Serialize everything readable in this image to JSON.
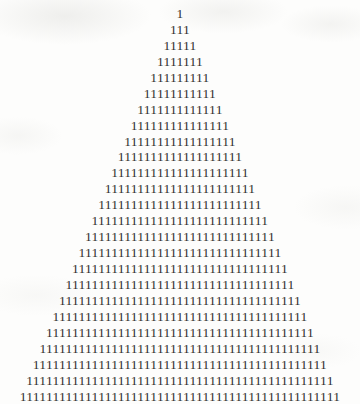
{
  "document": {
    "kind": "scanned-page-figure",
    "figure_name": "digit-one-pyramid",
    "character": "1",
    "background_color": "#fdfdfc",
    "ink_color": "#33312f",
    "row_count": 25,
    "total_characters": 625,
    "rows": [
      {
        "index": 1,
        "count": 1,
        "text": "1"
      },
      {
        "index": 2,
        "count": 3,
        "text": "111"
      },
      {
        "index": 3,
        "count": 5,
        "text": "11111"
      },
      {
        "index": 4,
        "count": 7,
        "text": "1111111"
      },
      {
        "index": 5,
        "count": 9,
        "text": "111111111"
      },
      {
        "index": 6,
        "count": 11,
        "text": "11111111111"
      },
      {
        "index": 7,
        "count": 13,
        "text": "1111111111111"
      },
      {
        "index": 8,
        "count": 15,
        "text": "111111111111111"
      },
      {
        "index": 9,
        "count": 17,
        "text": "11111111111111111"
      },
      {
        "index": 10,
        "count": 19,
        "text": "1111111111111111111"
      },
      {
        "index": 11,
        "count": 21,
        "text": "111111111111111111111"
      },
      {
        "index": 12,
        "count": 23,
        "text": "11111111111111111111111"
      },
      {
        "index": 13,
        "count": 25,
        "text": "1111111111111111111111111"
      },
      {
        "index": 14,
        "count": 27,
        "text": "111111111111111111111111111"
      },
      {
        "index": 15,
        "count": 29,
        "text": "11111111111111111111111111111"
      },
      {
        "index": 16,
        "count": 31,
        "text": "1111111111111111111111111111111"
      },
      {
        "index": 17,
        "count": 33,
        "text": "111111111111111111111111111111111"
      },
      {
        "index": 18,
        "count": 35,
        "text": "11111111111111111111111111111111111"
      },
      {
        "index": 19,
        "count": 37,
        "text": "1111111111111111111111111111111111111"
      },
      {
        "index": 20,
        "count": 39,
        "text": "111111111111111111111111111111111111111"
      },
      {
        "index": 21,
        "count": 41,
        "text": "11111111111111111111111111111111111111111"
      },
      {
        "index": 22,
        "count": 43,
        "text": "1111111111111111111111111111111111111111111"
      },
      {
        "index": 23,
        "count": 45,
        "text": "111111111111111111111111111111111111111111111"
      },
      {
        "index": 24,
        "count": 47,
        "text": "11111111111111111111111111111111111111111111111"
      },
      {
        "index": 25,
        "count": 49,
        "text": "1111111111111111111111111111111111111111111111111"
      }
    ]
  }
}
